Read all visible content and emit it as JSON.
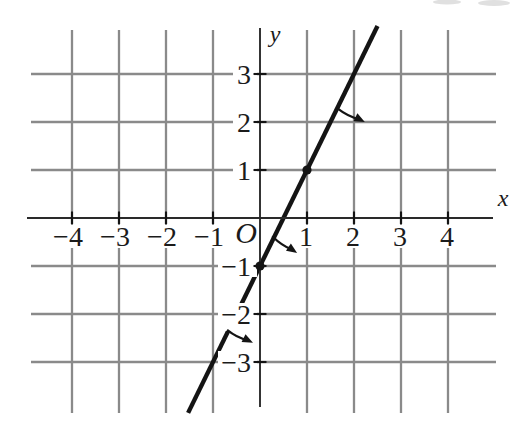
{
  "figure": {
    "canvas": {
      "width": 515,
      "height": 438
    },
    "colors": {
      "background": "#ffffff",
      "grid": "#8a8a8a",
      "axis": "#2a2a2a",
      "line": "#141414",
      "text": "#1b1b1b",
      "artifact": "#d8d8d8"
    },
    "geometry": {
      "origin_px": {
        "x": 260,
        "y": 218
      },
      "unit_px": {
        "x": 47,
        "y": 48
      },
      "grid_h_span_px": [
        31,
        496
      ],
      "grid_v_span_px": [
        30,
        413
      ],
      "x_axis_span_px": [
        27,
        493
      ],
      "y_axis_span_px": [
        28,
        407
      ],
      "stroke_px": {
        "grid": 2.3,
        "axis": 1.9,
        "line": 4.4,
        "arrow": 2.2,
        "tick": 2.1
      },
      "tick_half_len_px": 6.5,
      "point_radius_px": 4.6,
      "arrow_head": {
        "length": 10.5,
        "half_width": 4.4
      },
      "label_positions": {
        "origin": {
          "x": 246,
          "y": 243
        },
        "x_var": {
          "x": 503,
          "y": 206
        },
        "y_var": {
          "x": 275,
          "y": 42
        },
        "x_tick_baseline": 246,
        "y_tick_right_edge": 251
      }
    }
  },
  "chart_data": {
    "type": "line",
    "title": "",
    "xlabel": "x",
    "ylabel": "y",
    "origin_label": "O",
    "grid": true,
    "xlim": [
      -4.95,
      5.0
    ],
    "ylim": [
      -4.25,
      4.05
    ],
    "x_ticks": [
      {
        "value": -4,
        "label": "−4"
      },
      {
        "value": -3,
        "label": "−3"
      },
      {
        "value": -2,
        "label": "−2"
      },
      {
        "value": -1,
        "label": "−1"
      },
      {
        "value": 1,
        "label": "1"
      },
      {
        "value": 2,
        "label": "2"
      },
      {
        "value": 3,
        "label": "3"
      },
      {
        "value": 4,
        "label": "4"
      }
    ],
    "y_ticks": [
      {
        "value": 3,
        "label": "3"
      },
      {
        "value": 2,
        "label": "2"
      },
      {
        "value": 1,
        "label": "1"
      },
      {
        "value": -1,
        "label": "−1"
      },
      {
        "value": -2,
        "label": "−2"
      },
      {
        "value": -3,
        "label": "−3"
      }
    ],
    "series": [
      {
        "name": "line",
        "equation": "y = 2x − 1",
        "slope": 2,
        "intercept": -1,
        "x_range": [
          -1.53,
          2.5
        ],
        "gap_at_label": {
          "x": -0.55,
          "y": -2
        }
      }
    ],
    "marked_points": [
      {
        "x": 0,
        "y": -1
      },
      {
        "x": 1,
        "y": 1
      }
    ],
    "direction_arrows": [
      {
        "from": {
          "x": 1.64,
          "y": 2.29
        },
        "to": {
          "x": 2.23,
          "y": 2.0
        }
      },
      {
        "from": {
          "x": 0.26,
          "y": -0.38
        },
        "to": {
          "x": 0.79,
          "y": -0.73
        }
      },
      {
        "from": {
          "x": -0.7,
          "y": -2.33
        },
        "to": {
          "x": -0.15,
          "y": -2.6
        }
      }
    ]
  }
}
